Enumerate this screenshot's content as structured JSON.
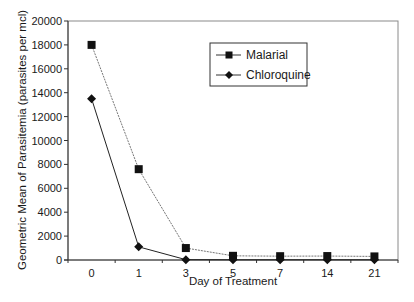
{
  "chart_data": {
    "type": "line",
    "title": "",
    "xlabel": "Day of Treatment",
    "ylabel": "Geometric Mean of Parasitemia (parasites per mcl)",
    "categories": [
      "0",
      "1",
      "3",
      "5",
      "7",
      "14",
      "21"
    ],
    "ylim": [
      0,
      20000
    ],
    "yticks": [
      0,
      2000,
      4000,
      6000,
      8000,
      10000,
      12000,
      14000,
      16000,
      18000,
      20000
    ],
    "grid": false,
    "legend_position": "upper right (inside plot)",
    "series": [
      {
        "name": "Malarial",
        "marker": "square",
        "line_style": "dotted-thin",
        "values": [
          18000,
          7600,
          1000,
          350,
          320,
          330,
          300
        ]
      },
      {
        "name": "Chloroquine",
        "marker": "diamond",
        "line_style": "solid",
        "values": [
          13500,
          1100,
          30,
          20,
          20,
          20,
          20
        ]
      }
    ]
  },
  "legend": {
    "items": [
      {
        "label": "Malarial"
      },
      {
        "label": "Chloroquine"
      }
    ]
  },
  "axes": {
    "x_title": "Day of Treatment",
    "y_title": "Geometric Mean of Parasitemia (parasites per mcl)"
  }
}
